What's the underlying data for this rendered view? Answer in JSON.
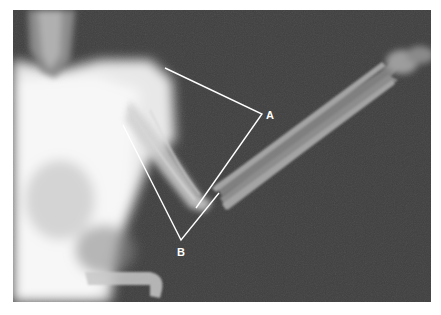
{
  "figure": {
    "type": "radiograph",
    "background_color": "#3f3f3f",
    "annotation_color": "#ffffff",
    "annotations": [
      {
        "label": "A",
        "points": [
          [
            165,
            68
          ],
          [
            262,
            114
          ],
          [
            196,
            208
          ]
        ],
        "label_pos": [
          271,
          118
        ]
      },
      {
        "label": "B",
        "points": [
          [
            123,
            125
          ],
          [
            181,
            240
          ],
          [
            219,
            193
          ]
        ],
        "label_pos": [
          181,
          254
        ]
      }
    ]
  }
}
